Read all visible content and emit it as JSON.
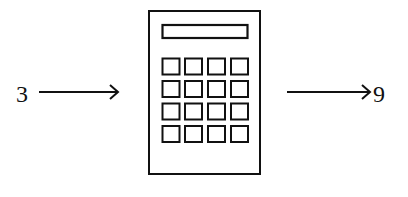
{
  "diagram": {
    "input": {
      "label": "3"
    },
    "machine": {
      "type": "calculator",
      "display": "",
      "keys_rows": 4,
      "keys_cols": 4
    },
    "output": {
      "label": "9"
    }
  },
  "colors": {
    "stroke": "#111111",
    "background": "#ffffff"
  }
}
